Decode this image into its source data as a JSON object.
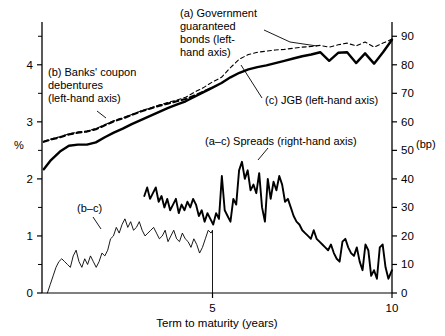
{
  "chart_data": {
    "type": "line",
    "title": "",
    "xlabel": "Term to maturity (years)",
    "ylabel_left": "%",
    "ylabel_right": "(bp)",
    "xlim": [
      0.25,
      10
    ],
    "ylim_left": [
      0,
      4.75
    ],
    "ylim_right": [
      0,
      95
    ],
    "grid": false,
    "legend_position": "inline-annotations",
    "x_ticks": [
      5,
      10
    ],
    "x_tick_labels": [
      "5",
      "10"
    ],
    "y_ticks_left": [
      0,
      1,
      2,
      3,
      4
    ],
    "y_tick_labels_left": [
      "0",
      "1",
      "2",
      "3",
      "4"
    ],
    "y_minor_ticks_left": [
      0.5,
      1.5,
      2.5,
      3.5,
      4.5
    ],
    "y_ticks_right": [
      0,
      10,
      20,
      30,
      40,
      50,
      60,
      70,
      80,
      90
    ],
    "y_tick_labels_right": [
      "0",
      "10",
      "20",
      "30",
      "40",
      "50",
      "60",
      "70",
      "80",
      "90"
    ],
    "series": [
      {
        "name": "(a) Government guaranteed bonds",
        "axis": "left",
        "style": "dashed-fine",
        "x": [
          0.3,
          0.5,
          0.75,
          1.0,
          1.25,
          1.5,
          1.75,
          2.0,
          2.25,
          2.5,
          2.75,
          3.0,
          3.25,
          3.5,
          3.75,
          4.0,
          4.25,
          4.5,
          4.75,
          5.0,
          5.25,
          5.5,
          5.75,
          6.0,
          6.25,
          6.5,
          6.75,
          7.0,
          7.25,
          7.5,
          7.75,
          8.0,
          8.25,
          8.5,
          8.75,
          9.0,
          9.25,
          9.5,
          9.75,
          10.0
        ],
        "y": [
          2.66,
          2.7,
          2.74,
          2.79,
          2.82,
          2.84,
          2.88,
          2.95,
          3.02,
          3.07,
          3.13,
          3.19,
          3.24,
          3.29,
          3.34,
          3.38,
          3.43,
          3.52,
          3.6,
          3.7,
          3.78,
          3.95,
          4.1,
          4.18,
          4.22,
          4.24,
          4.26,
          4.27,
          4.29,
          4.31,
          4.32,
          4.34,
          4.31,
          4.35,
          4.38,
          4.33,
          4.4,
          4.31,
          4.38,
          4.45
        ]
      },
      {
        "name": "(b) Banks' coupon debentures",
        "axis": "left",
        "style": "dashed-bold",
        "x": [
          0.3,
          0.5,
          0.75,
          1.0,
          1.25,
          1.5,
          1.75,
          2.0,
          2.25,
          2.5,
          2.75,
          3.0,
          3.25,
          3.5,
          3.75,
          4.0,
          4.25,
          4.5,
          4.75,
          5.0
        ],
        "y": [
          2.65,
          2.69,
          2.73,
          2.78,
          2.81,
          2.83,
          2.87,
          2.94,
          3.01,
          3.06,
          3.12,
          3.18,
          3.23,
          3.28,
          3.32,
          3.36,
          3.4,
          3.46,
          3.53,
          3.6
        ]
      },
      {
        "name": "(c) JGB",
        "axis": "left",
        "style": "solid-bold",
        "x": [
          0.3,
          0.5,
          0.75,
          1.0,
          1.25,
          1.5,
          1.75,
          2.0,
          2.25,
          2.5,
          2.75,
          3.0,
          3.25,
          3.5,
          3.75,
          4.0,
          4.25,
          4.5,
          4.75,
          5.0,
          5.25,
          5.5,
          5.75,
          6.0,
          6.25,
          6.5,
          6.75,
          7.0,
          7.25,
          7.5,
          7.75,
          8.0,
          8.25,
          8.5,
          8.75,
          9.0,
          9.25,
          9.5,
          9.75,
          10.0
        ],
        "y": [
          2.17,
          2.33,
          2.48,
          2.58,
          2.6,
          2.6,
          2.64,
          2.73,
          2.81,
          2.88,
          2.96,
          3.03,
          3.1,
          3.17,
          3.24,
          3.3,
          3.36,
          3.44,
          3.52,
          3.6,
          3.68,
          3.78,
          3.86,
          3.92,
          3.96,
          3.99,
          4.03,
          4.07,
          4.11,
          4.15,
          4.18,
          4.22,
          4.07,
          4.21,
          4.22,
          4.03,
          4.2,
          4.02,
          4.22,
          4.44
        ]
      },
      {
        "name": "(a–c) Spreads",
        "axis": "right",
        "style": "solid-bold-thin",
        "x": [
          3.1,
          3.18,
          3.26,
          3.34,
          3.42,
          3.5,
          3.58,
          3.66,
          3.74,
          3.82,
          3.9,
          3.98,
          4.06,
          4.14,
          4.22,
          4.3,
          4.38,
          4.46,
          4.54,
          4.62,
          4.7,
          4.78,
          4.86,
          4.94,
          5.02,
          5.1,
          5.18,
          5.26,
          5.34,
          5.42,
          5.5,
          5.58,
          5.66,
          5.74,
          5.82,
          5.9,
          5.98,
          6.06,
          6.14,
          6.22,
          6.3,
          6.38,
          6.46,
          6.54,
          6.62,
          6.7,
          6.78,
          6.86,
          6.94,
          7.02,
          7.1,
          7.18,
          7.26,
          7.34,
          7.42,
          7.5,
          7.58,
          7.66,
          7.74,
          7.82,
          7.9,
          7.98,
          8.06,
          8.14,
          8.22,
          8.3,
          8.38,
          8.46,
          8.54,
          8.62,
          8.7,
          8.78,
          8.86,
          8.94,
          9.02,
          9.1,
          9.18,
          9.26,
          9.34,
          9.42,
          9.5,
          9.58,
          9.66,
          9.74,
          9.82,
          9.9,
          10.0
        ],
        "y": [
          34,
          37,
          33,
          35,
          37,
          32,
          34,
          30,
          33,
          29,
          31,
          33,
          28,
          31,
          29,
          32,
          30,
          33,
          31,
          27,
          29,
          25,
          28,
          26,
          24,
          28,
          26,
          41,
          29,
          27,
          25,
          33,
          31,
          43,
          46,
          40,
          43,
          36,
          38,
          35,
          42,
          30,
          25,
          40,
          33,
          39,
          36,
          41,
          38,
          32,
          33,
          30,
          27,
          25,
          24,
          22,
          21,
          20,
          19,
          22,
          19,
          18,
          17,
          16,
          15,
          17,
          14,
          12,
          11,
          18,
          19,
          16,
          14,
          13,
          16,
          11,
          8,
          17,
          15,
          6,
          8,
          5,
          16,
          17,
          9,
          5,
          8
        ]
      },
      {
        "name": "(b–c)",
        "axis": "right",
        "style": "solid-thin",
        "x": [
          0.4,
          0.48,
          0.56,
          0.64,
          0.72,
          0.8,
          0.88,
          0.96,
          1.04,
          1.12,
          1.2,
          1.28,
          1.36,
          1.44,
          1.52,
          1.6,
          1.68,
          1.76,
          1.84,
          1.92,
          2.0,
          2.08,
          2.16,
          2.24,
          2.32,
          2.4,
          2.48,
          2.56,
          2.64,
          2.72,
          2.8,
          2.88,
          2.96,
          3.04,
          3.12,
          3.2,
          3.28,
          3.36,
          3.44,
          3.52,
          3.6,
          3.68,
          3.76,
          3.84,
          3.92,
          4.0,
          4.08,
          4.16,
          4.24,
          4.32,
          4.4,
          4.48,
          4.56,
          4.64,
          4.72,
          4.8,
          4.88,
          4.96,
          5.0,
          5.0
        ],
        "y": [
          0,
          3,
          6,
          9,
          11,
          12,
          11,
          10,
          9,
          13,
          15,
          11,
          9,
          12,
          10,
          13,
          11,
          9,
          11,
          14,
          13,
          15,
          19,
          20,
          23,
          21,
          24,
          26,
          23,
          25,
          22,
          23,
          25,
          22,
          20,
          21,
          22,
          23,
          21,
          19,
          20,
          22,
          18,
          20,
          22,
          19,
          18,
          21,
          19,
          18,
          16,
          19,
          17,
          14,
          16,
          19,
          22,
          21,
          22,
          0
        ]
      }
    ]
  },
  "annotations": {
    "a_label": {
      "lines": [
        "(a) Government",
        "guaranteed",
        "bonds (left-",
        "hand axis)"
      ],
      "full": "(a) Government guaranteed bonds (left-hand axis)"
    },
    "b_label": {
      "lines": [
        "(b) Banks' coupon",
        "debentures",
        "(left-hand axis)"
      ],
      "full": "(b) Banks' coupon debentures (left-hand axis)"
    },
    "c_label": {
      "text": "(c) JGB (left-hand axis)"
    },
    "spreads_label": {
      "text": "(a–c) Spreads (right-hand axis)"
    },
    "bc_label": {
      "text": "(b–c)"
    }
  },
  "axes": {
    "left_unit": "%",
    "right_unit": "(bp)",
    "x_title": "Term to maturity (years)"
  },
  "colors": {
    "line": "#000000",
    "background": "#ffffff",
    "axis": "#000000"
  }
}
